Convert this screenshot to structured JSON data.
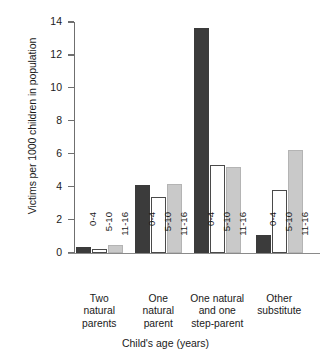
{
  "chart_data": {
    "type": "bar",
    "title": "",
    "xlabel": "Child's age (years)",
    "ylabel": "Victims per 1000 children in population",
    "ylim": [
      0,
      14
    ],
    "yticks": [
      0,
      2,
      4,
      6,
      8,
      10,
      12,
      14
    ],
    "ytick_labels": [
      "0",
      "2",
      "4",
      "6",
      "8",
      "10",
      "12",
      "14"
    ],
    "grid": false,
    "legend": "none",
    "categories": [
      "Two natural parents",
      "One natural parent",
      "One natural and one step-parent",
      "Other substitute"
    ],
    "category_label_lines": [
      [
        "Two",
        "natural",
        "parents"
      ],
      [
        "One",
        "natural",
        "parent"
      ],
      [
        "One natural",
        "and  one",
        "step-parent"
      ],
      [
        "Other",
        "substitute"
      ]
    ],
    "subcategories": [
      "0-4",
      "5-10",
      "11-16"
    ],
    "series": [
      {
        "name": "0-4",
        "color": "#3b3b3b",
        "values": [
          0.35,
          4.1,
          13.65,
          1.1
        ]
      },
      {
        "name": "5-10",
        "color": "#ffffff",
        "values": [
          0.2,
          3.35,
          5.35,
          3.8
        ]
      },
      {
        "name": "11-16",
        "color": "#c9c9c9",
        "values": [
          0.45,
          4.15,
          5.2,
          6.25
        ]
      }
    ]
  },
  "colors": {
    "bar_dark": "#3b3b3b",
    "bar_white": "#ffffff",
    "bar_gray": "#c9c9c9",
    "axis": "#6f6f6f",
    "text": "#1a1a1a",
    "background": "#ffffff"
  }
}
